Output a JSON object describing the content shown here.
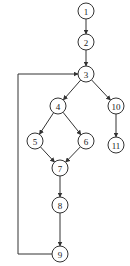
{
  "diagram": {
    "type": "control-flow-graph",
    "nodes": [
      {
        "id": "1",
        "label": "1",
        "cx": 86,
        "cy": 11
      },
      {
        "id": "2",
        "label": "2",
        "cx": 86,
        "cy": 42
      },
      {
        "id": "3",
        "label": "3",
        "cx": 86,
        "cy": 74
      },
      {
        "id": "4",
        "label": "4",
        "cx": 58,
        "cy": 106
      },
      {
        "id": "10",
        "label": "10",
        "cx": 116,
        "cy": 106
      },
      {
        "id": "5",
        "label": "5",
        "cx": 35,
        "cy": 141
      },
      {
        "id": "6",
        "label": "6",
        "cx": 86,
        "cy": 141
      },
      {
        "id": "11",
        "label": "11",
        "cx": 116,
        "cy": 145
      },
      {
        "id": "7",
        "label": "7",
        "cx": 60,
        "cy": 168
      },
      {
        "id": "8",
        "label": "8",
        "cx": 60,
        "cy": 205
      },
      {
        "id": "9",
        "label": "9",
        "cx": 60,
        "cy": 254
      }
    ],
    "edges": [
      {
        "from": "1",
        "to": "2"
      },
      {
        "from": "2",
        "to": "3"
      },
      {
        "from": "3",
        "to": "4"
      },
      {
        "from": "3",
        "to": "10"
      },
      {
        "from": "4",
        "to": "5"
      },
      {
        "from": "4",
        "to": "6"
      },
      {
        "from": "5",
        "to": "7"
      },
      {
        "from": "6",
        "to": "7"
      },
      {
        "from": "7",
        "to": "8"
      },
      {
        "from": "8",
        "to": "9"
      },
      {
        "from": "10",
        "to": "11"
      },
      {
        "from": "9",
        "to": "3",
        "routing": "loop-left",
        "loop_x": 18
      }
    ],
    "node_radius": 8
  }
}
